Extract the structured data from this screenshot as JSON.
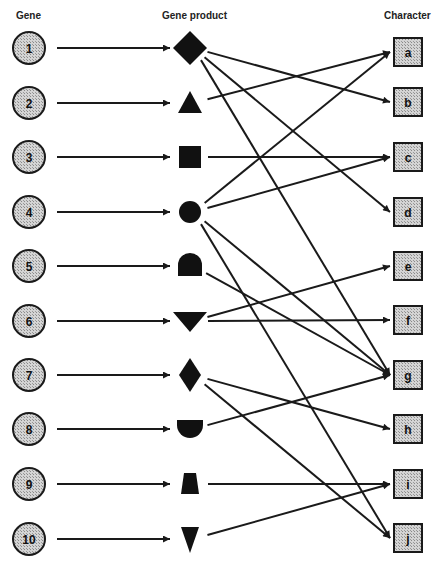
{
  "headers": {
    "gene": "Gene",
    "product": "Gene product",
    "character": "Character"
  },
  "colors": {
    "stroke": "#1a1a1a",
    "node_fill": "#c8c8c8",
    "shape_fill": "#111111",
    "background": "#ffffff"
  },
  "genes": [
    {
      "id": "1",
      "y": 48,
      "product": "diamond-large"
    },
    {
      "id": "2",
      "y": 103,
      "product": "triangle-up"
    },
    {
      "id": "3",
      "y": 157,
      "product": "square"
    },
    {
      "id": "4",
      "y": 212,
      "product": "circle"
    },
    {
      "id": "5",
      "y": 266,
      "product": "bell"
    },
    {
      "id": "6",
      "y": 321,
      "product": "triangle-down-wide"
    },
    {
      "id": "7",
      "y": 375,
      "product": "diamond-tall"
    },
    {
      "id": "8",
      "y": 429,
      "product": "cup"
    },
    {
      "id": "9",
      "y": 484,
      "product": "trapezoid"
    },
    {
      "id": "10",
      "y": 539,
      "product": "triangle-down-narrow"
    }
  ],
  "characters": [
    {
      "id": "a",
      "y": 52
    },
    {
      "id": "b",
      "y": 102
    },
    {
      "id": "c",
      "y": 157
    },
    {
      "id": "d",
      "y": 212
    },
    {
      "id": "e",
      "y": 266
    },
    {
      "id": "f",
      "y": 320
    },
    {
      "id": "g",
      "y": 375
    },
    {
      "id": "h",
      "y": 429
    },
    {
      "id": "i",
      "y": 484
    },
    {
      "id": "j",
      "y": 538
    }
  ],
  "connections": [
    {
      "from": "1",
      "to": [
        "b",
        "d",
        "g"
      ]
    },
    {
      "from": "2",
      "to": [
        "a"
      ]
    },
    {
      "from": "3",
      "to": [
        "c"
      ]
    },
    {
      "from": "4",
      "to": [
        "a",
        "c",
        "g",
        "j"
      ]
    },
    {
      "from": "5",
      "to": [
        "g"
      ]
    },
    {
      "from": "6",
      "to": [
        "e",
        "f"
      ]
    },
    {
      "from": "7",
      "to": [
        "h",
        "j"
      ]
    },
    {
      "from": "8",
      "to": [
        "g"
      ]
    },
    {
      "from": "9",
      "to": [
        "i"
      ]
    },
    {
      "from": "10",
      "to": [
        "i"
      ]
    }
  ]
}
